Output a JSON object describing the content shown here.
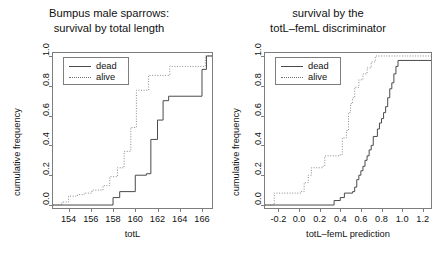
{
  "figure": {
    "background": "#ffffff",
    "panels": 2,
    "width": 437,
    "height": 266
  },
  "chart_data": [
    {
      "type": "line",
      "subtype": "ecdf-step",
      "panel": "left",
      "title": "Bumpus male sparrows:\nsurvival by total length",
      "title_lines": [
        "Bumpus male sparrows:",
        "survival by total length"
      ],
      "xlabel": "totL",
      "ylabel": "cumulative frequency",
      "xlim": [
        152.6,
        166.9
      ],
      "ylim": [
        -0.02,
        1.02
      ],
      "xticks": [
        154,
        156,
        158,
        160,
        162,
        164,
        166
      ],
      "xticklabels": [
        "154",
        "156",
        "158",
        "160",
        "162",
        "164",
        "166"
      ],
      "yticks": [
        0.0,
        0.2,
        0.4,
        0.6,
        0.8,
        1.0
      ],
      "yticklabels": [
        "0.0",
        "0.2",
        "0.4",
        "0.6",
        "0.8",
        "1.0"
      ],
      "grid": false,
      "legend": {
        "position": "top-left",
        "entries": [
          {
            "label": "dead",
            "style": "solid",
            "color": "#4a4a4a"
          },
          {
            "label": "alive",
            "style": "dotted",
            "color": "#8a8a8a"
          }
        ]
      },
      "series": [
        {
          "name": "dead",
          "style": "solid",
          "color": "#4a4a4a",
          "x": [
            152.6,
            156.0,
            158.0,
            158.5,
            159.0,
            160.0,
            161.0,
            161.5,
            162.0,
            162.5,
            163.0,
            166.9
          ],
          "y": [
            0.0,
            0.0,
            0.05,
            0.09,
            0.09,
            0.2,
            0.21,
            0.44,
            0.57,
            0.7,
            0.73,
            0.73
          ],
          "steps": [
            {
              "x": 156.0,
              "y": 0.0
            },
            {
              "x": 158.0,
              "y": 0.05
            },
            {
              "x": 158.6,
              "y": 0.09
            },
            {
              "x": 160.0,
              "y": 0.2
            },
            {
              "x": 161.0,
              "y": 0.21
            },
            {
              "x": 161.4,
              "y": 0.44
            },
            {
              "x": 162.0,
              "y": 0.57
            },
            {
              "x": 162.5,
              "y": 0.7
            },
            {
              "x": 163.0,
              "y": 0.73
            },
            {
              "x": 166.0,
              "y": 0.91
            },
            {
              "x": 166.4,
              "y": 1.0
            }
          ]
        },
        {
          "name": "alive",
          "style": "dotted",
          "color": "#8a8a8a",
          "x": [
            152.6,
            153.5,
            154.0,
            154.7,
            155.3,
            156.0,
            157.0,
            157.6,
            158.3,
            159.0,
            159.6,
            160.0,
            161.0,
            163.0,
            166.9
          ],
          "y": [
            0.0,
            0.02,
            0.06,
            0.07,
            0.08,
            0.09,
            0.12,
            0.18,
            0.24,
            0.35,
            0.51,
            0.77,
            0.86,
            0.92,
            1.0
          ],
          "steps": [
            {
              "x": 153.4,
              "y": 0.02
            },
            {
              "x": 154.0,
              "y": 0.06
            },
            {
              "x": 154.8,
              "y": 0.07
            },
            {
              "x": 155.4,
              "y": 0.08
            },
            {
              "x": 156.1,
              "y": 0.1
            },
            {
              "x": 157.1,
              "y": 0.13
            },
            {
              "x": 157.7,
              "y": 0.19
            },
            {
              "x": 158.4,
              "y": 0.25
            },
            {
              "x": 159.0,
              "y": 0.36
            },
            {
              "x": 159.6,
              "y": 0.52
            },
            {
              "x": 160.1,
              "y": 0.77
            },
            {
              "x": 161.2,
              "y": 0.87
            },
            {
              "x": 163.1,
              "y": 0.93
            },
            {
              "x": 166.3,
              "y": 1.0
            }
          ]
        }
      ]
    },
    {
      "type": "line",
      "subtype": "ecdf-step",
      "panel": "right",
      "title": "survival by the\ntotL-femL discriminator",
      "title_lines": [
        "survival by the",
        "totL–femL discriminator"
      ],
      "xlabel": "totL–femL prediction",
      "ylabel": "cumulative frequency",
      "xlim": [
        -0.33,
        1.28
      ],
      "ylim": [
        -0.02,
        1.02
      ],
      "xticks": [
        -0.2,
        0.0,
        0.2,
        0.4,
        0.6,
        0.8,
        1.0,
        1.2
      ],
      "xticklabels": [
        "-0.2",
        "0.0",
        "0.2",
        "0.4",
        "0.6",
        "0.8",
        "1.0",
        "1.2"
      ],
      "yticks": [
        0.0,
        0.2,
        0.4,
        0.6,
        0.8,
        1.0
      ],
      "yticklabels": [
        "0.0",
        "0.2",
        "0.4",
        "0.6",
        "0.8",
        "1.0"
      ],
      "grid": false,
      "legend": {
        "position": "top-left",
        "entries": [
          {
            "label": "dead",
            "style": "solid",
            "color": "#4a4a4a"
          },
          {
            "label": "alive",
            "style": "dotted",
            "color": "#8a8a8a"
          }
        ]
      },
      "series": [
        {
          "name": "dead",
          "style": "solid",
          "color": "#4a4a4a",
          "steps": [
            {
              "x": 0.31,
              "y": 0.0
            },
            {
              "x": 0.34,
              "y": 0.03
            },
            {
              "x": 0.4,
              "y": 0.05
            },
            {
              "x": 0.44,
              "y": 0.08
            },
            {
              "x": 0.52,
              "y": 0.09
            },
            {
              "x": 0.54,
              "y": 0.12
            },
            {
              "x": 0.56,
              "y": 0.17
            },
            {
              "x": 0.58,
              "y": 0.2
            },
            {
              "x": 0.6,
              "y": 0.23
            },
            {
              "x": 0.62,
              "y": 0.26
            },
            {
              "x": 0.64,
              "y": 0.3
            },
            {
              "x": 0.66,
              "y": 0.33
            },
            {
              "x": 0.68,
              "y": 0.37
            },
            {
              "x": 0.7,
              "y": 0.4
            },
            {
              "x": 0.72,
              "y": 0.46
            },
            {
              "x": 0.76,
              "y": 0.51
            },
            {
              "x": 0.78,
              "y": 0.55
            },
            {
              "x": 0.8,
              "y": 0.58
            },
            {
              "x": 0.82,
              "y": 0.62
            },
            {
              "x": 0.84,
              "y": 0.66
            },
            {
              "x": 0.86,
              "y": 0.72
            },
            {
              "x": 0.88,
              "y": 0.78
            },
            {
              "x": 0.9,
              "y": 0.82
            },
            {
              "x": 0.92,
              "y": 0.88
            },
            {
              "x": 0.94,
              "y": 0.93
            },
            {
              "x": 0.96,
              "y": 0.97
            },
            {
              "x": 1.26,
              "y": 0.97
            }
          ]
        },
        {
          "name": "alive",
          "style": "dotted",
          "color": "#8a8a8a",
          "steps": [
            {
              "x": -0.26,
              "y": 0.0
            },
            {
              "x": -0.24,
              "y": 0.08
            },
            {
              "x": 0.02,
              "y": 0.09
            },
            {
              "x": 0.05,
              "y": 0.15
            },
            {
              "x": 0.09,
              "y": 0.2
            },
            {
              "x": 0.12,
              "y": 0.25
            },
            {
              "x": 0.23,
              "y": 0.26
            },
            {
              "x": 0.25,
              "y": 0.33
            },
            {
              "x": 0.4,
              "y": 0.34
            },
            {
              "x": 0.42,
              "y": 0.45
            },
            {
              "x": 0.46,
              "y": 0.5
            },
            {
              "x": 0.48,
              "y": 0.62
            },
            {
              "x": 0.5,
              "y": 0.68
            },
            {
              "x": 0.52,
              "y": 0.72
            },
            {
              "x": 0.54,
              "y": 0.79
            },
            {
              "x": 0.58,
              "y": 0.84
            },
            {
              "x": 0.62,
              "y": 0.88
            },
            {
              "x": 0.66,
              "y": 0.92
            },
            {
              "x": 0.7,
              "y": 0.96
            },
            {
              "x": 0.74,
              "y": 1.0
            },
            {
              "x": 1.26,
              "y": 1.0
            }
          ]
        }
      ]
    }
  ]
}
